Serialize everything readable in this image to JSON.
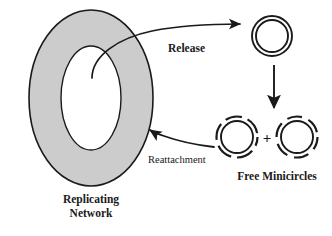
{
  "figure": {
    "width": 332,
    "height": 236,
    "background_color": "#ffffff",
    "stroke_color": "#1a1a1a",
    "network_fill_color": "#cccccc",
    "network_hole_color": "#ffffff"
  },
  "network": {
    "label_line1": "Replicating",
    "label_line2": "Network",
    "shape": "gray-filled-ellipse-annulus"
  },
  "released_minicircle": {
    "name": "closed-minicircle",
    "description": "double concentric solid ring"
  },
  "free_minicircles": {
    "label": "Free Minicircles",
    "plus_symbol": "+",
    "left_circle_name": "nicked-minicircle-left",
    "right_circle_name": "nicked-minicircle-right"
  },
  "arrows": {
    "release_label": "Release",
    "reattachment_label": "Reattachment",
    "replication_arrow_name": "replication-down-arrow"
  }
}
